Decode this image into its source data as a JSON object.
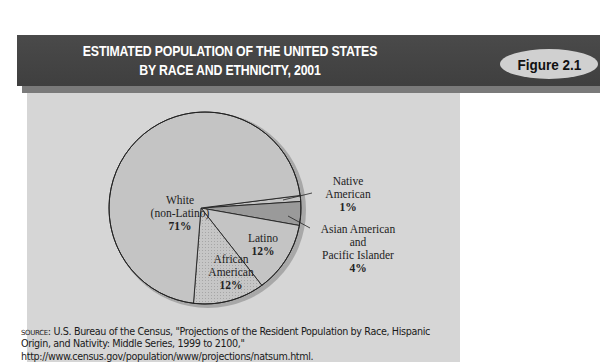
{
  "header": {
    "title_line1": "ESTIMATED POPULATION OF THE UNITED STATES",
    "title_line2": "BY RACE AND ETHNICITY, 2001",
    "figure_label": "Figure 2.1"
  },
  "colors": {
    "header_bg": "#444444",
    "panel_bg": "#d6d6d6",
    "slice_light": "#c4c4c4",
    "slice_asian": "#9a9a9a",
    "badge_bg": "#d0d0d0"
  },
  "labels": {
    "white": {
      "name1": "White",
      "name2": "(non-Latino)",
      "pct": "71%"
    },
    "african_american": {
      "name1": "African",
      "name2": "American",
      "pct": "12%"
    },
    "latino": {
      "name1": "Latino",
      "pct": "12%"
    },
    "native_american": {
      "name1": "Native",
      "name2": "American",
      "pct": "1%"
    },
    "asian": {
      "name1": "Asian American",
      "name2": "and",
      "name3": "Pacific Islander",
      "pct": "4%"
    }
  },
  "source": {
    "prefix": "SOURCE:",
    "line1": " U.S. Bureau of the Census, \"Projections of the Resident Population by Race, Hispanic",
    "line2": "Origin, and Nativity: Middle Series, 1999 to 2100,\"",
    "line3": "http://www.census.gov/population/www/projections/natsum.html."
  },
  "chart_data": {
    "type": "pie",
    "title": "Estimated Population of the United States by Race and Ethnicity, 2001",
    "categories": [
      "White (non-Latino)",
      "African American",
      "Latino",
      "Asian American and Pacific Islander",
      "Native American"
    ],
    "values": [
      71,
      12,
      12,
      4,
      1
    ],
    "unit": "%",
    "legend": "none (direct labels)",
    "source": "U.S. Bureau of the Census, \"Projections of the Resident Population by Race, Hispanic Origin, and Nativity: Middle Series, 1999 to 2100,\""
  }
}
